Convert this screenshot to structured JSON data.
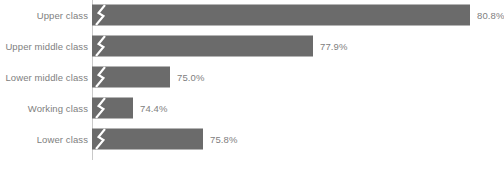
{
  "chart_data": {
    "type": "bar",
    "orientation": "horizontal",
    "title": "",
    "subtitle": "",
    "xlabel": "",
    "ylabel": "",
    "categories": [
      "Upper class",
      "Upper middle class",
      "Lower middle class",
      "Working class",
      "Lower class"
    ],
    "values": [
      80.8,
      77.9,
      75.0,
      74.4,
      75.8
    ],
    "value_labels": [
      "80.8%",
      "77.9%",
      "75.0%",
      "74.4%",
      "75.8%"
    ],
    "value_suffix": "%",
    "axis_break": true,
    "axis_break_symbol": "zigzag",
    "grid": false,
    "legend": false,
    "xlim": [
      0,
      100
    ],
    "bar_color": "#6b6b6b",
    "axis_color": "#c9c9c9",
    "label_color": "#808080",
    "background_color": "#ffffff",
    "bars": [
      {
        "category": "Upper class",
        "value": 80.8,
        "label": "80.8%",
        "bar_px": 378
      },
      {
        "category": "Upper middle class",
        "value": 77.9,
        "label": "77.9%",
        "bar_px": 221
      },
      {
        "category": "Lower middle class",
        "value": 75.0,
        "label": "75.0%",
        "bar_px": 78
      },
      {
        "category": "Working class",
        "value": 74.4,
        "label": "74.4%",
        "bar_px": 41
      },
      {
        "category": "Lower class",
        "value": 75.8,
        "label": "75.8%",
        "bar_px": 111
      }
    ]
  }
}
